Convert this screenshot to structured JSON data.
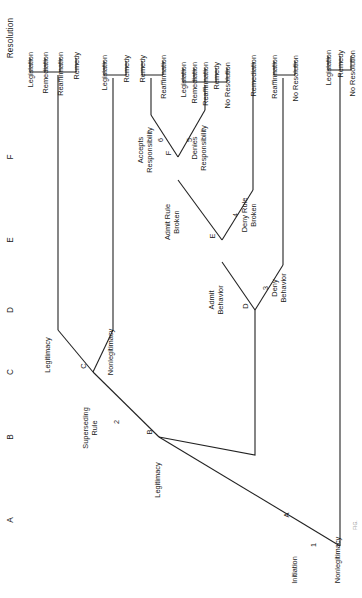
{
  "figure": {
    "orientation": "rotated-90-ccw",
    "caption": "FIG."
  },
  "columns": [
    {
      "id": "A",
      "label": "A",
      "y": 520
    },
    {
      "id": "B",
      "label": "B",
      "y": 437
    },
    {
      "id": "C",
      "label": "C",
      "y": 372
    },
    {
      "id": "D",
      "label": "D",
      "y": 310
    },
    {
      "id": "E",
      "label": "E",
      "y": 240
    },
    {
      "id": "F",
      "label": "F",
      "y": 157
    },
    {
      "id": "R",
      "label": "Resolution",
      "y": 38
    }
  ],
  "nodes": [
    {
      "id": "A",
      "label": "A",
      "decision": "1",
      "stage_label": "Initiation"
    },
    {
      "id": "B",
      "label": "B",
      "decision": "2",
      "stage_label": "Legitimacy"
    },
    {
      "id": "C",
      "label": "C",
      "decision": "",
      "stage_label": "Superseding Rule"
    },
    {
      "id": "D",
      "label": "D",
      "decision": "3",
      "stage_label": ""
    },
    {
      "id": "E",
      "label": "E",
      "decision": "4",
      "stage_label": "Admit Behavior"
    },
    {
      "id": "F",
      "label": "F",
      "decision_left": "6",
      "decision_right": "5",
      "stage_label": "Admit Rule Broken"
    }
  ],
  "branch_labels": {
    "a_up": "Legitimacy",
    "a_down": "Nonlegitimacy",
    "b_up": "Superseding Rule",
    "c_up": "Legitimacy",
    "c_down": "Nonlegitimacy",
    "d_up": "Admit Behavior",
    "d_down": "Deny Behavior",
    "e_up": "Admit Rule Broken",
    "e_down": "Deny Rule Broken",
    "f_up": "Accepts Responsibility",
    "f_down": "Denies Responsibility"
  },
  "decision_numbers": [
    "1",
    "2",
    "3",
    "4",
    "5",
    "6"
  ],
  "outcome_groups": [
    {
      "id": "g1",
      "from": "C-up",
      "outcomes": [
        "Legislation",
        "Remediation",
        "Reaffirmation",
        "Remedy"
      ]
    },
    {
      "id": "g2",
      "from": "C-down",
      "outcomes": [
        "Legislation",
        "Remedy"
      ]
    },
    {
      "id": "g3",
      "from": "F-up",
      "outcomes": [
        "Remedy",
        "Reaffirmation"
      ]
    },
    {
      "id": "g4",
      "from": "F-down",
      "outcomes": [
        "Legislation",
        "Remediation",
        "Reaffirmation",
        "Remedy",
        "No Resolution"
      ]
    },
    {
      "id": "g5",
      "from": "E-down",
      "outcomes": [
        "Remediation"
      ]
    },
    {
      "id": "g6",
      "from": "D-down",
      "outcomes": [
        "Reaffirmation",
        "No Resolution"
      ]
    },
    {
      "id": "g7",
      "from": "A-down",
      "outcomes": [
        "Legislation",
        "Remedy",
        "No Resolution"
      ]
    }
  ],
  "colors": {
    "ink": "#1a1a1a",
    "line": "#222222",
    "paper": "#ffffff"
  }
}
